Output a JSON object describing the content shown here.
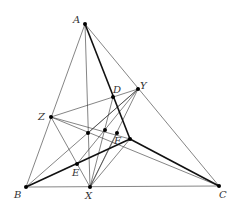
{
  "diagram": {
    "type": "geometry-figure",
    "points": {
      "A": {
        "label": "A",
        "x": 85,
        "y": 24,
        "lx": 73,
        "ly": 23
      },
      "B": {
        "label": "B",
        "x": 26,
        "y": 187,
        "lx": 14,
        "ly": 198
      },
      "C": {
        "label": "C",
        "x": 219,
        "y": 186,
        "lx": 219,
        "ly": 198
      },
      "X": {
        "label": "X",
        "x": 90,
        "y": 187,
        "lx": 85,
        "ly": 199
      },
      "Y": {
        "label": "Y",
        "x": 138,
        "y": 89,
        "lx": 140,
        "ly": 89
      },
      "Z": {
        "label": "Z",
        "x": 51,
        "y": 117,
        "lx": 38,
        "ly": 120
      },
      "D": {
        "label": "D",
        "x": 113,
        "y": 97,
        "lx": 113,
        "ly": 93
      },
      "E": {
        "label": "E",
        "x": 77,
        "y": 164,
        "lx": 72,
        "ly": 176
      },
      "F": {
        "label": "F",
        "x": 130,
        "y": 139,
        "lx": 114,
        "ly": 144
      },
      "P1": {
        "label": "",
        "x": 88,
        "y": 133
      },
      "P2": {
        "label": "",
        "x": 105,
        "y": 130
      },
      "P3": {
        "label": "",
        "x": 117,
        "y": 133
      }
    },
    "labels": [
      "A",
      "B",
      "C",
      "D",
      "E",
      "F",
      "X",
      "Y",
      "Z"
    ]
  }
}
